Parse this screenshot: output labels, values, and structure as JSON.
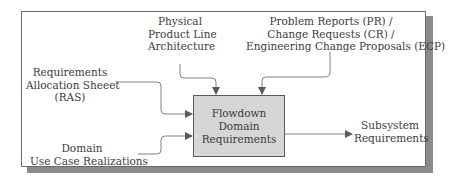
{
  "diagram": {
    "process": {
      "lines": [
        "Flowdown",
        "Domain",
        "Requirements"
      ]
    },
    "inputs": [
      {
        "id": "physical-architecture",
        "lines": [
          "Physical",
          "Product Line",
          "Architecture"
        ]
      },
      {
        "id": "change-requests",
        "lines": [
          "Problem Reports (PR) /",
          "Change Requests (CR) /",
          "Engineering Change Proposals (ECP)"
        ]
      },
      {
        "id": "ras",
        "lines": [
          "Requirements",
          "Allocation Sheeet",
          "(RAS)"
        ]
      },
      {
        "id": "use-case-realizations",
        "lines": [
          "Domain",
          "Use Case Realizations"
        ]
      }
    ],
    "outputs": [
      {
        "id": "subsystem-requirements",
        "lines": [
          "Subsystem",
          "Requirements"
        ]
      }
    ],
    "colors": {
      "process_fill": "#d6d6d6",
      "frame_shadow": "#8a8a8a",
      "line": "#777777",
      "arrowhead": "#555555"
    }
  }
}
